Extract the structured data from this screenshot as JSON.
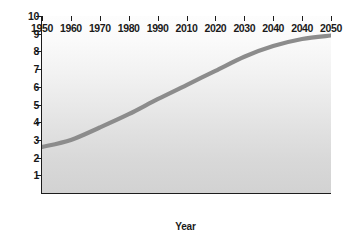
{
  "chart_data": {
    "type": "line",
    "title": "",
    "xlabel": "Year",
    "ylabel": "Population (billions)",
    "xlim": [
      1950,
      2050
    ],
    "ylim": [
      0,
      10
    ],
    "grid": false,
    "legend": false,
    "xtick_labels": [
      "1950",
      "1960",
      "1970",
      "1980",
      "1990",
      "2010",
      "2020",
      "2030",
      "2040",
      "2040",
      "2050"
    ],
    "xtick_values": [
      1950,
      1960,
      1970,
      1980,
      1990,
      2000,
      2010,
      2020,
      2030,
      2040,
      2050
    ],
    "ytick_labels": [
      "1",
      "2",
      "3",
      "4",
      "5",
      "6",
      "7",
      "8",
      "9",
      "10"
    ],
    "ytick_values": [
      1,
      2,
      3,
      4,
      5,
      6,
      7,
      8,
      9,
      10
    ],
    "series": [
      {
        "name": "World population",
        "color": "#8c8c8c",
        "x": [
          1950,
          1960,
          1970,
          1980,
          1990,
          2000,
          2010,
          2020,
          2030,
          2040,
          2050
        ],
        "values": [
          2.6,
          3.0,
          3.7,
          4.45,
          5.3,
          6.1,
          6.9,
          7.7,
          8.3,
          8.7,
          8.9
        ]
      }
    ],
    "plot_background": {
      "type": "vertical-gradient",
      "top_color": "#fdfdfd",
      "bottom_color": "#d2d2d2"
    },
    "axis_color": "#1c1c1c",
    "figure_background": "#ffffff"
  }
}
